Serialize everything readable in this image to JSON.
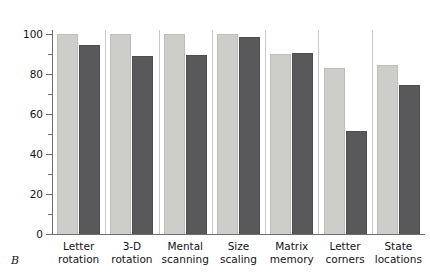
{
  "panel": {
    "letter": "B"
  },
  "chart_data": {
    "type": "bar",
    "title": "",
    "xlabel": "",
    "ylabel": "Percent correct",
    "ylim": [
      0,
      100
    ],
    "ytick_labels": [
      "0",
      "20",
      "40",
      "60",
      "80",
      "100"
    ],
    "ytick_values": [
      0,
      20,
      40,
      60,
      80,
      100
    ],
    "yminor_values": [
      10,
      30,
      50,
      70,
      90
    ],
    "grid": false,
    "legend": "none",
    "categories": [
      "Letter\nrotation",
      "3-D\nrotation",
      "Mental\nscanning",
      "Size\nscaling",
      "Matrix\nmemory",
      "Letter\ncorners",
      "State\nlocations"
    ],
    "series": [
      {
        "name": "light",
        "color": "#cdcdc9",
        "values": [
          100,
          100,
          100,
          100,
          90,
          83,
          84.5
        ]
      },
      {
        "name": "dark",
        "color": "#59595b",
        "values": [
          94.5,
          89,
          89.5,
          98.5,
          90.5,
          51.5,
          74.5
        ]
      }
    ]
  },
  "colors": {
    "light_bar": "#cdcdc9",
    "dark_bar": "#59595b",
    "axis": "#6e6e6e",
    "separator": "#c9c9c9",
    "text": "#141414",
    "background": "#ffffff"
  }
}
